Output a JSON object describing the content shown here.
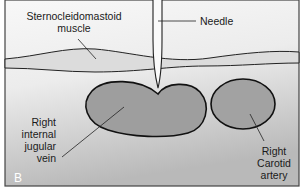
{
  "figure": {
    "panel_letter": "B",
    "colors": {
      "background_top": "#f7f7f7",
      "background_bottom": "#bdbdbd",
      "vessel_fill": "#9d9d9d",
      "muscle_fill": "#d9d9d9",
      "outline": "#111111",
      "border": "#444444"
    },
    "labels": {
      "muscle": {
        "line1": "Sternocleidomastoid",
        "line2": "muscle"
      },
      "needle": "Needle",
      "vein": {
        "line1": "Right",
        "line2": "internal",
        "line3": "jugular",
        "line4": "vein"
      },
      "artery": {
        "line1": "Right",
        "line2": "Carotid",
        "line3": "artery"
      }
    }
  }
}
